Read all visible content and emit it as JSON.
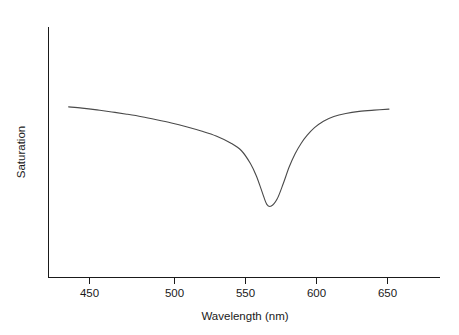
{
  "chart_data": {
    "type": "line",
    "title": "",
    "xlabel": "Wavelength (nm)",
    "ylabel": "Saturation",
    "xlim": [
      436,
      651
    ],
    "ylim": [
      0,
      1
    ],
    "grid": false,
    "legend": null,
    "xticks": [
      450,
      500,
      550,
      600,
      650
    ],
    "xticklabels": [
      "450",
      "500",
      "550",
      "600",
      "650"
    ],
    "yticks": [],
    "yticklabels": [],
    "series": [
      {
        "name": "saturation",
        "color": "#4a4a4a",
        "x": [
          436,
          445,
          455,
          465,
          475,
          485,
          495,
          505,
          515,
          525,
          535,
          545,
          552,
          558,
          562,
          566,
          569,
          572,
          576,
          580,
          584,
          588,
          592,
          596,
          601,
          607,
          614,
          622,
          631,
          641,
          651
        ],
        "y": [
          0.681,
          0.676,
          0.669,
          0.661,
          0.652,
          0.642,
          0.63,
          0.617,
          0.602,
          0.585,
          0.565,
          0.536,
          0.506,
          0.455,
          0.405,
          0.339,
          0.292,
          0.285,
          0.314,
          0.374,
          0.441,
          0.494,
          0.535,
          0.567,
          0.598,
          0.624,
          0.643,
          0.655,
          0.663,
          0.668,
          0.672
        ]
      }
    ],
    "annotations": []
  },
  "axis": {
    "x_title": "Wavelength (nm)",
    "y_title": "Saturation",
    "x_tick_labels": [
      "450",
      "500",
      "550",
      "600",
      "650"
    ]
  },
  "colors": {
    "curve": "#4a4a4a",
    "axis": "#1a1a1a",
    "background": "#ffffff",
    "text": "#1a1a1a"
  }
}
